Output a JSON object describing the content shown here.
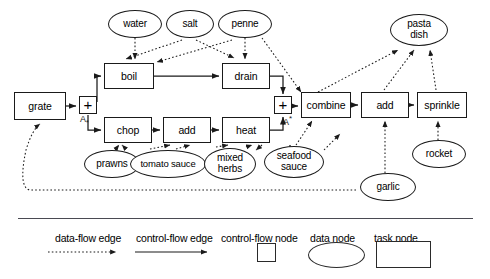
{
  "diagram": {
    "task_nodes": [
      {
        "id": "grate",
        "label": "grate",
        "x": 14,
        "y": 92,
        "w": 52,
        "h": 28
      },
      {
        "id": "boil",
        "label": "boil",
        "x": 104,
        "y": 63,
        "w": 50,
        "h": 26
      },
      {
        "id": "drain",
        "label": "drain",
        "x": 222,
        "y": 63,
        "w": 48,
        "h": 26
      },
      {
        "id": "chop",
        "label": "chop",
        "x": 104,
        "y": 117,
        "w": 48,
        "h": 26
      },
      {
        "id": "add1",
        "label": "add",
        "x": 163,
        "y": 117,
        "w": 48,
        "h": 26
      },
      {
        "id": "heat",
        "label": "heat",
        "x": 222,
        "y": 117,
        "w": 48,
        "h": 26
      },
      {
        "id": "combine",
        "label": "combine",
        "x": 301,
        "y": 92,
        "w": 50,
        "h": 26
      },
      {
        "id": "add2",
        "label": "add",
        "x": 361,
        "y": 92,
        "w": 48,
        "h": 26
      },
      {
        "id": "sprinkle",
        "label": "sprinkle",
        "x": 417,
        "y": 92,
        "w": 50,
        "h": 26
      }
    ],
    "data_nodes": [
      {
        "id": "water",
        "label": "water",
        "x": 108,
        "y": 10,
        "w": 54,
        "h": 28
      },
      {
        "id": "salt",
        "label": "salt",
        "x": 166,
        "y": 10,
        "w": 48,
        "h": 28
      },
      {
        "id": "penne",
        "label": "penne",
        "x": 218,
        "y": 10,
        "w": 54,
        "h": 28
      },
      {
        "id": "pastadish",
        "label": "pasta\ndish",
        "x": 390,
        "y": 14,
        "w": 58,
        "h": 32
      },
      {
        "id": "prawns",
        "label": "prawns",
        "x": 84,
        "y": 150,
        "w": 56,
        "h": 28
      },
      {
        "id": "tomatosauce",
        "label": "tomato sauce",
        "x": 130,
        "y": 150,
        "w": 76,
        "h": 28
      },
      {
        "id": "mixedherbs",
        "label": "mixed\nherbs",
        "x": 204,
        "y": 148,
        "w": 52,
        "h": 32
      },
      {
        "id": "seafoodsauce",
        "label": "seafood\nsauce",
        "x": 264,
        "y": 146,
        "w": 60,
        "h": 32
      },
      {
        "id": "garlic",
        "label": "garlic",
        "x": 360,
        "y": 173,
        "w": 56,
        "h": 28
      },
      {
        "id": "rocket",
        "label": "rocket",
        "x": 412,
        "y": 140,
        "w": 54,
        "h": 28
      }
    ],
    "control_nodes": [
      {
        "id": "join1",
        "symbol": "+",
        "label": "A",
        "sublabel": "*",
        "x": 79,
        "y": 96,
        "size": 18
      },
      {
        "id": "join2",
        "symbol": "+",
        "label": "A",
        "sublabel": "*",
        "x": 274,
        "y": 96,
        "size": 18
      }
    ],
    "colors": {
      "stroke": "#1a1a1a",
      "divider": "#4a4a52",
      "background": "#ffffff"
    }
  },
  "legend": {
    "items": [
      {
        "id": "data-flow-edge",
        "label": "data-flow edge",
        "symbol": "dotted-arrow",
        "label_x": 55,
        "label_y": 232
      },
      {
        "id": "control-flow-edge",
        "label": "control-flow edge",
        "symbol": "solid-arrow",
        "label_x": 136,
        "label_y": 232
      },
      {
        "id": "control-flow-node",
        "label": "control-flow node",
        "symbol": "square",
        "label_x": 221,
        "label_y": 232
      },
      {
        "id": "data-node",
        "label": "data node",
        "symbol": "ellipse",
        "label_x": 310,
        "label_y": 232
      },
      {
        "id": "task-node",
        "label": "task node",
        "symbol": "rectangle",
        "label_x": 374,
        "label_y": 232
      }
    ]
  }
}
